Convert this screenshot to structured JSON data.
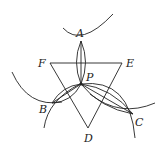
{
  "diagram": {
    "type": "geometric-construction",
    "colors": {
      "stroke": "#222222",
      "background": "#ffffff"
    },
    "points": {
      "A": {
        "label": "A",
        "x": 81,
        "y": 41
      },
      "B": {
        "label": "B",
        "x": 52,
        "y": 103
      },
      "C": {
        "label": "C",
        "x": 133,
        "y": 114
      },
      "D": {
        "label": "D",
        "x": 88,
        "y": 128
      },
      "E": {
        "label": "E",
        "x": 122,
        "y": 63
      },
      "F": {
        "label": "F",
        "x": 50,
        "y": 63
      },
      "P": {
        "label": "P",
        "x": 81,
        "y": 84
      }
    },
    "labels": {
      "A": "A",
      "B": "B",
      "C": "C",
      "D": "D",
      "E": "E",
      "F": "F",
      "P": "P"
    },
    "segments": [
      [
        "F",
        "E"
      ],
      [
        "E",
        "D"
      ],
      [
        "D",
        "F"
      ],
      [
        "P",
        "A"
      ],
      [
        "P",
        "B"
      ],
      [
        "P",
        "C"
      ]
    ]
  }
}
